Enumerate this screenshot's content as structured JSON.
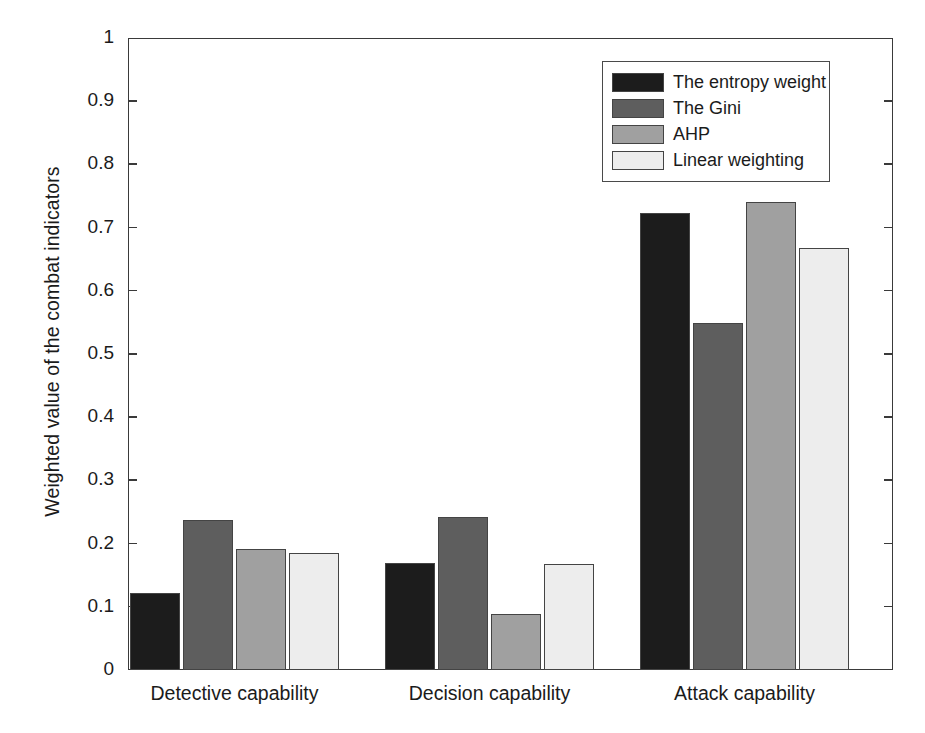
{
  "chart_data": {
    "type": "bar",
    "title": "",
    "xlabel": "",
    "ylabel": "Weighted value of the combat indicators",
    "categories": [
      "Detective capability",
      "Decision capability",
      "Attack capability"
    ],
    "series": [
      {
        "name": "The entropy weight",
        "color": "#1c1c1c",
        "values": [
          0.122,
          0.169,
          0.723
        ]
      },
      {
        "name": "The Gini",
        "color": "#5e5e5e",
        "values": [
          0.237,
          0.242,
          0.549
        ]
      },
      {
        "name": "AHP",
        "color": "#a0a0a0",
        "values": [
          0.191,
          0.088,
          0.74
        ]
      },
      {
        "name": "Linear weighting",
        "color": "#ededed",
        "values": [
          0.185,
          0.167,
          0.668
        ]
      }
    ],
    "ylim": [
      0,
      1
    ],
    "yticks": [
      "0",
      "0.1",
      "0.2",
      "0.3",
      "0.4",
      "0.5",
      "0.6",
      "0.7",
      "0.8",
      "0.9",
      "1"
    ],
    "ytick_values": [
      0,
      0.1,
      0.2,
      0.3,
      0.4,
      0.5,
      0.6,
      0.7,
      0.8,
      0.9,
      1
    ],
    "grid": false,
    "legend_position": "top-right",
    "axis_color": "#3a3a3a",
    "background": "#ffffff"
  },
  "legend": {
    "entries": [
      {
        "label": "The entropy weight"
      },
      {
        "label": "The Gini"
      },
      {
        "label": "AHP"
      },
      {
        "label": "Linear weighting"
      }
    ]
  }
}
